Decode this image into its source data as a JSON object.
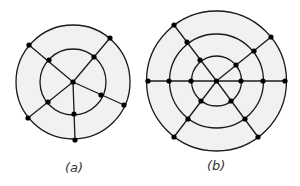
{
  "colors": {
    "stroke": "#1a1a1a",
    "fill": "#f1f1f1",
    "vertex": "#000000",
    "background": "#ffffff"
  },
  "figures": [
    {
      "id": "a",
      "label": "(a)",
      "center": [
        73,
        82
      ],
      "circles": [
        57,
        33
      ],
      "vertices": [
        [
          73,
          82
        ],
        [
          29,
          45
        ],
        [
          49,
          60
        ],
        [
          110,
          38
        ],
        [
          94,
          57
        ],
        [
          28,
          118
        ],
        [
          48,
          102
        ],
        [
          75,
          140
        ],
        [
          74,
          114
        ],
        [
          124,
          105
        ],
        [
          101,
          95
        ]
      ],
      "edges": [
        [
          [
            73,
            82
          ],
          [
            29,
            45
          ]
        ],
        [
          [
            73,
            82
          ],
          [
            110,
            38
          ]
        ],
        [
          [
            73,
            82
          ],
          [
            28,
            118
          ]
        ],
        [
          [
            73,
            82
          ],
          [
            75,
            140
          ]
        ],
        [
          [
            73,
            82
          ],
          [
            124,
            105
          ]
        ]
      ]
    },
    {
      "id": "b",
      "label": "(b)",
      "center": [
        216.5,
        81
      ],
      "circles": [
        70,
        47,
        25
      ],
      "vertices": [
        [
          216.5,
          81
        ],
        [
          148,
          81
        ],
        [
          169,
          81
        ],
        [
          191,
          81
        ],
        [
          241,
          81
        ],
        [
          263,
          81
        ],
        [
          285,
          81
        ],
        [
          174,
          25
        ],
        [
          187,
          42
        ],
        [
          200,
          60
        ],
        [
          271,
          37
        ],
        [
          254,
          51
        ],
        [
          236,
          65
        ],
        [
          174,
          137
        ],
        [
          188,
          119
        ],
        [
          201,
          101
        ],
        [
          258,
          137
        ],
        [
          245,
          119
        ],
        [
          231,
          101
        ]
      ],
      "edges": [
        [
          [
            146.5,
            81
          ],
          [
            286.5,
            81
          ]
        ],
        [
          [
            216.5,
            81
          ],
          [
            174,
            25
          ]
        ],
        [
          [
            216.5,
            81
          ],
          [
            271,
            37
          ]
        ],
        [
          [
            216.5,
            81
          ],
          [
            174,
            137
          ]
        ],
        [
          [
            216.5,
            81
          ],
          [
            258,
            137
          ]
        ]
      ]
    }
  ],
  "labels": {
    "a": "(a)",
    "b": "(b)"
  }
}
